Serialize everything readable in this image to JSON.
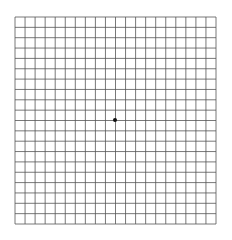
{
  "diagram": {
    "type": "amsler-grid",
    "columns": 20,
    "rows": 20,
    "grid_left": 15,
    "grid_top": 17,
    "grid_right": 216,
    "grid_bottom": 224,
    "line_color": "#555555",
    "background_color": "#ffffff",
    "center_dot": {
      "x": 115,
      "y": 120,
      "radius": 2,
      "color": "#111111"
    }
  }
}
